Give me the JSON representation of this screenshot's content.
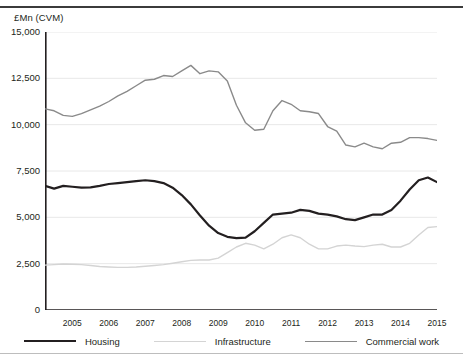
{
  "axis": {
    "y_title": "£Mn (CVM)",
    "y_ticks": [
      "15,000",
      "12,500",
      "10,000",
      "7,500",
      "5,000",
      "2,500",
      "0"
    ],
    "x_ticks": [
      "2005",
      "2006",
      "2007",
      "2008",
      "2009",
      "2010",
      "2011",
      "2012",
      "2013",
      "2014",
      "2015"
    ]
  },
  "legend": {
    "items": [
      {
        "label": "Housing",
        "color": "#231f20",
        "swatch": "line-swatch-housing"
      },
      {
        "label": "Infrastructure",
        "color": "#d4d4d4",
        "swatch": "line-swatch-infrastructure"
      },
      {
        "label": "Commercial work",
        "color": "#8a8a8a",
        "swatch": "line-swatch-commercial"
      }
    ]
  },
  "chart_data": {
    "type": "line",
    "title": "",
    "xlabel": "",
    "ylabel": "£Mn (CVM)",
    "ylim": [
      0,
      15000
    ],
    "yticks": [
      0,
      2500,
      5000,
      7500,
      10000,
      12500,
      15000
    ],
    "xlim": [
      2004.25,
      2015.0
    ],
    "xticks": [
      2005,
      2006,
      2007,
      2008,
      2009,
      2010,
      2011,
      2012,
      2013,
      2014,
      2015
    ],
    "grid": "horizontal",
    "legend_position": "bottom",
    "x": [
      2004.25,
      2004.5,
      2004.75,
      2005.0,
      2005.25,
      2005.5,
      2005.75,
      2006.0,
      2006.25,
      2006.5,
      2006.75,
      2007.0,
      2007.25,
      2007.5,
      2007.75,
      2008.0,
      2008.25,
      2008.5,
      2008.75,
      2009.0,
      2009.25,
      2009.5,
      2009.75,
      2010.0,
      2010.25,
      2010.5,
      2010.75,
      2011.0,
      2011.25,
      2011.5,
      2011.75,
      2012.0,
      2012.25,
      2012.5,
      2012.75,
      2013.0,
      2013.25,
      2013.5,
      2013.75,
      2014.0,
      2014.25,
      2014.5,
      2014.75,
      2015.0
    ],
    "series": [
      {
        "name": "Housing",
        "color": "#231f20",
        "width": 2.2,
        "values": [
          6700,
          6550,
          6700,
          6650,
          6600,
          6620,
          6700,
          6800,
          6850,
          6900,
          6950,
          7000,
          6950,
          6850,
          6600,
          6200,
          5700,
          5100,
          4550,
          4150,
          3950,
          3880,
          3900,
          4250,
          4700,
          5150,
          5200,
          5250,
          5400,
          5350,
          5200,
          5150,
          5050,
          4900,
          4850,
          5000,
          5150,
          5150,
          5400,
          5900,
          6500,
          7000,
          7150,
          6900
        ]
      },
      {
        "name": "Infrastructure",
        "color": "#d4d4d4",
        "width": 1.4,
        "values": [
          2420,
          2450,
          2480,
          2470,
          2450,
          2400,
          2350,
          2320,
          2300,
          2300,
          2320,
          2360,
          2400,
          2450,
          2520,
          2600,
          2680,
          2700,
          2700,
          2800,
          3100,
          3400,
          3600,
          3500,
          3300,
          3550,
          3900,
          4050,
          3900,
          3550,
          3300,
          3300,
          3450,
          3500,
          3450,
          3420,
          3500,
          3550,
          3400,
          3400,
          3600,
          4050,
          4450,
          4500
        ]
      },
      {
        "name": "Commercial work",
        "color": "#8a8a8a",
        "width": 1.4,
        "values": [
          10850,
          10750,
          10500,
          10450,
          10600,
          10800,
          11000,
          11250,
          11550,
          11800,
          12100,
          12400,
          12450,
          12650,
          12600,
          12900,
          13200,
          12750,
          12900,
          12850,
          12350,
          11050,
          10100,
          9700,
          9750,
          10750,
          11300,
          11100,
          10750,
          10700,
          10600,
          9900,
          9650,
          8900,
          8800,
          9000,
          8800,
          8700,
          9000,
          9050,
          9300,
          9300,
          9250,
          9150
        ]
      }
    ]
  }
}
